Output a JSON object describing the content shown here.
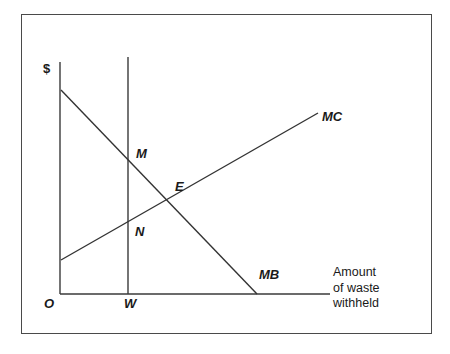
{
  "figure": {
    "type": "economics-line-diagram",
    "title_visible": false,
    "border_color": "#4a4a4a",
    "line_color": "#333333",
    "background": "#ffffff"
  },
  "axes": {
    "y_label": "$",
    "origin_label": "O",
    "x_caption_line1": "Amount",
    "x_caption_line2": "of waste",
    "x_caption_line3": "withheld",
    "x_axis_name": "Amount of waste withheld",
    "y_axis_name": "$"
  },
  "markers": {
    "w_label": "W",
    "m_label": "M",
    "e_label": "E",
    "n_label": "N"
  },
  "curves": {
    "mc_label": "MC",
    "mb_label": "MB"
  },
  "chart_data": {
    "type": "line",
    "title": "",
    "xlabel": "Amount of waste withheld",
    "ylabel": "$",
    "grid": false,
    "legend": "inline-end-labels",
    "xlim": [
      0,
      100
    ],
    "ylim": [
      0,
      100
    ],
    "axis_pixels": {
      "y_axis_x": 60,
      "y_axis_top_y": 62,
      "x_axis_y": 294,
      "x_axis_right_x": 330
    },
    "series": [
      {
        "name": "MB",
        "label": "MB",
        "description": "Marginal benefit, downward sloping",
        "points_px": [
          [
            61,
            90
          ],
          [
            257,
            294
          ]
        ],
        "endpoint_label_px": [
          259,
          268
        ]
      },
      {
        "name": "MC",
        "label": "MC",
        "description": "Marginal cost, upward sloping",
        "points_px": [
          [
            61,
            260
          ],
          [
            318,
            113
          ]
        ],
        "endpoint_label_px": [
          322,
          110
        ]
      },
      {
        "name": "W",
        "label": "W",
        "description": "Vertical line at quantity W",
        "points_px": [
          [
            128,
            57
          ],
          [
            128,
            294
          ]
        ],
        "endpoint_label_px": [
          124,
          297
        ]
      }
    ],
    "annotations": [
      {
        "text": "M",
        "px": [
          128,
          163
        ],
        "note": "MB at quantity W"
      },
      {
        "text": "E",
        "px": [
          168,
          200
        ],
        "note": "MB = MC efficient point"
      },
      {
        "text": "N",
        "px": [
          128,
          222
        ],
        "note": "MC at quantity W"
      },
      {
        "text": "O",
        "px": [
          60,
          294
        ],
        "note": "origin"
      },
      {
        "text": "$",
        "px": [
          60,
          62
        ],
        "note": "vertical axis units"
      }
    ]
  }
}
